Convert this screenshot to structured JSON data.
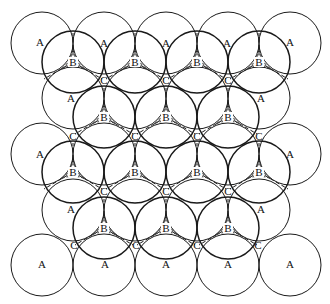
{
  "diagram": {
    "colors": {
      "background": "#ffffff",
      "stroke": "#1a1a1a",
      "label": "#111111"
    },
    "radius": 31,
    "layer_a": {
      "label": "A",
      "centers": [
        [
          42,
          43
        ],
        [
          104,
          43
        ],
        [
          166,
          43
        ],
        [
          228,
          43
        ],
        [
          290,
          43
        ],
        [
          73,
          98
        ],
        [
          135,
          98
        ],
        [
          197,
          98
        ],
        [
          259,
          98
        ],
        [
          42,
          154
        ],
        [
          104,
          154
        ],
        [
          166,
          154
        ],
        [
          228,
          154
        ],
        [
          290,
          154
        ],
        [
          73,
          210
        ],
        [
          135,
          210
        ],
        [
          197,
          210
        ],
        [
          259,
          210
        ],
        [
          42,
          265
        ],
        [
          104,
          265
        ],
        [
          166,
          265
        ],
        [
          228,
          265
        ],
        [
          290,
          265
        ]
      ],
      "label_positions": [
        [
          40,
          46
        ],
        [
          104,
          47
        ],
        [
          166,
          47
        ],
        [
          227,
          47
        ],
        [
          290,
          46
        ],
        [
          71,
          102
        ],
        [
          261,
          102
        ],
        [
          40,
          158
        ],
        [
          290,
          158
        ],
        [
          71,
          213
        ],
        [
          261,
          213
        ],
        [
          42,
          268
        ],
        [
          105,
          268
        ],
        [
          166,
          268
        ],
        [
          228,
          268
        ],
        [
          290,
          268
        ]
      ]
    },
    "layer_b": {
      "label": "B",
      "centers": [
        [
          73,
          62
        ],
        [
          135,
          62
        ],
        [
          197,
          62
        ],
        [
          259,
          62
        ],
        [
          104,
          117
        ],
        [
          166,
          117
        ],
        [
          228,
          117
        ],
        [
          73,
          172
        ],
        [
          135,
          172
        ],
        [
          197,
          172
        ],
        [
          259,
          172
        ],
        [
          104,
          228
        ],
        [
          166,
          228
        ],
        [
          228,
          228
        ]
      ]
    },
    "layer_c": {
      "label": "C",
      "positions": [
        [
          104,
          80
        ],
        [
          166,
          80
        ],
        [
          228,
          80
        ],
        [
          73,
          136
        ],
        [
          135,
          136
        ],
        [
          197,
          136
        ],
        [
          259,
          136
        ],
        [
          104,
          191
        ],
        [
          166,
          191
        ],
        [
          228,
          191
        ],
        [
          74,
          245
        ],
        [
          136,
          245
        ],
        [
          197,
          245
        ],
        [
          258,
          245
        ]
      ]
    }
  }
}
